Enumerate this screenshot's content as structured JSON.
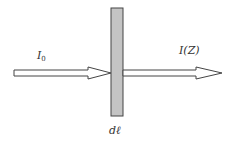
{
  "diagram": {
    "type": "beam-through-slab",
    "labels": {
      "incident_symbol": "I",
      "incident_subscript": "0",
      "transmitted": "I(Z)",
      "thickness": "dℓ"
    },
    "colors": {
      "slab_fill": "#c4c4c4",
      "stroke": "#444444",
      "arrow_fill": "#ffffff",
      "background": "#ffffff"
    }
  }
}
